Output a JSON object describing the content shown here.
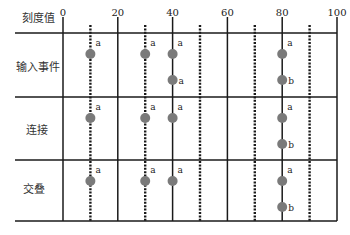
{
  "header": {
    "axis_label": "刻度值"
  },
  "ticks": [
    {
      "value": 0,
      "label": "0"
    },
    {
      "value": 20,
      "label": "20"
    },
    {
      "value": 40,
      "label": "40"
    },
    {
      "value": 60,
      "label": "60"
    },
    {
      "value": 80,
      "label": "80"
    },
    {
      "value": 100,
      "label": "100"
    }
  ],
  "dotted_lines": [
    10,
    30,
    50,
    70,
    90
  ],
  "rows": [
    {
      "label": "输入事件",
      "events": [
        {
          "x": 10,
          "level": 1,
          "label": "a"
        },
        {
          "x": 30,
          "level": 1,
          "label": "a"
        },
        {
          "x": 40,
          "level": 1,
          "label": "a"
        },
        {
          "x": 40,
          "level": 2,
          "label": "a"
        },
        {
          "x": 80,
          "level": 1,
          "label": "a"
        },
        {
          "x": 80,
          "level": 2,
          "label": "b"
        }
      ]
    },
    {
      "label": "连接",
      "events": [
        {
          "x": 10,
          "level": 1,
          "label": "a"
        },
        {
          "x": 30,
          "level": 1,
          "label": "a"
        },
        {
          "x": 40,
          "level": 1,
          "label": "a"
        },
        {
          "x": 80,
          "level": 1,
          "label": "a"
        },
        {
          "x": 80,
          "level": 2,
          "label": "b"
        }
      ]
    },
    {
      "label": "交叠",
      "events": [
        {
          "x": 10,
          "level": 1,
          "label": "a"
        },
        {
          "x": 30,
          "level": 1,
          "label": "a"
        },
        {
          "x": 40,
          "level": 1,
          "label": "a"
        },
        {
          "x": 80,
          "level": 1,
          "label": "a"
        },
        {
          "x": 80,
          "level": 2,
          "label": "b"
        }
      ]
    }
  ],
  "colors": {
    "line": "#1a1a1a",
    "event": "#7a7a7a"
  }
}
